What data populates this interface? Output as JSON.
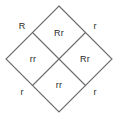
{
  "diagram": {
    "type": "punnett-square",
    "orientation": "diamond",
    "line_color": "#6b6b6b",
    "text_color": "#2b2b2b",
    "background_color": "#ffffff",
    "geometry": {
      "top_vertex": [
        59,
        6
      ],
      "right_vertex": [
        112,
        59
      ],
      "bottom_vertex": [
        59,
        112
      ],
      "left_vertex": [
        6,
        59
      ],
      "center": [
        59,
        59
      ]
    },
    "cells": [
      {
        "id": "cell-top",
        "genotype": "Rr",
        "x": 59,
        "y": 33
      },
      {
        "id": "cell-left",
        "genotype": "rr",
        "x": 33,
        "y": 59
      },
      {
        "id": "cell-right",
        "genotype": "Rr",
        "x": 85,
        "y": 59
      },
      {
        "id": "cell-bottom",
        "genotype": "rr",
        "x": 59,
        "y": 85
      }
    ],
    "alleles": [
      {
        "id": "allele-top-left",
        "symbol": "R",
        "x": 22,
        "y": 26
      },
      {
        "id": "allele-top-right",
        "symbol": "r",
        "x": 95,
        "y": 26
      },
      {
        "id": "allele-bottom-left",
        "symbol": "r",
        "x": 22,
        "y": 92
      },
      {
        "id": "allele-bottom-right",
        "symbol": "r",
        "x": 95,
        "y": 92
      }
    ]
  }
}
